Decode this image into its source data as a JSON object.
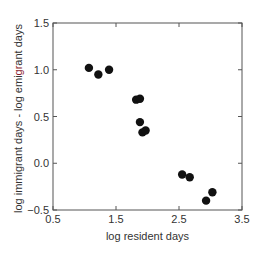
{
  "chart_data": {
    "type": "scatter",
    "title": "",
    "xlabel": "log resident days",
    "ylabel_parts": [
      "log immigrant days - log emi",
      "gr",
      "ant days"
    ],
    "ylabel": "log immigrant days - log emigrant days",
    "xlim": [
      0.5,
      3.5
    ],
    "ylim": [
      -0.5,
      1.5
    ],
    "xticks": [
      0.5,
      1.5,
      2.5,
      3.5
    ],
    "xtick_labels": [
      "0.5",
      "1.5",
      "2.5",
      "3.5"
    ],
    "yticks": [
      -0.5,
      0.0,
      0.5,
      1.0,
      1.5
    ],
    "ytick_labels": [
      "−0.5",
      "0.0",
      "0.5",
      "1.0",
      "1.5"
    ],
    "grid": false,
    "legend": null,
    "series": [
      {
        "name": "points",
        "color": "#111111",
        "x": [
          1.07,
          1.22,
          1.39,
          1.82,
          1.88,
          1.88,
          1.92,
          1.97,
          2.55,
          2.67,
          2.93,
          3.03
        ],
        "y": [
          1.02,
          0.95,
          1.0,
          0.68,
          0.69,
          0.44,
          0.33,
          0.35,
          -0.12,
          -0.15,
          -0.4,
          -0.31
        ]
      }
    ]
  },
  "colors": {
    "axis": "#555555",
    "point": "#111111",
    "text": "#333333",
    "highlight": "#8b1a2b"
  }
}
